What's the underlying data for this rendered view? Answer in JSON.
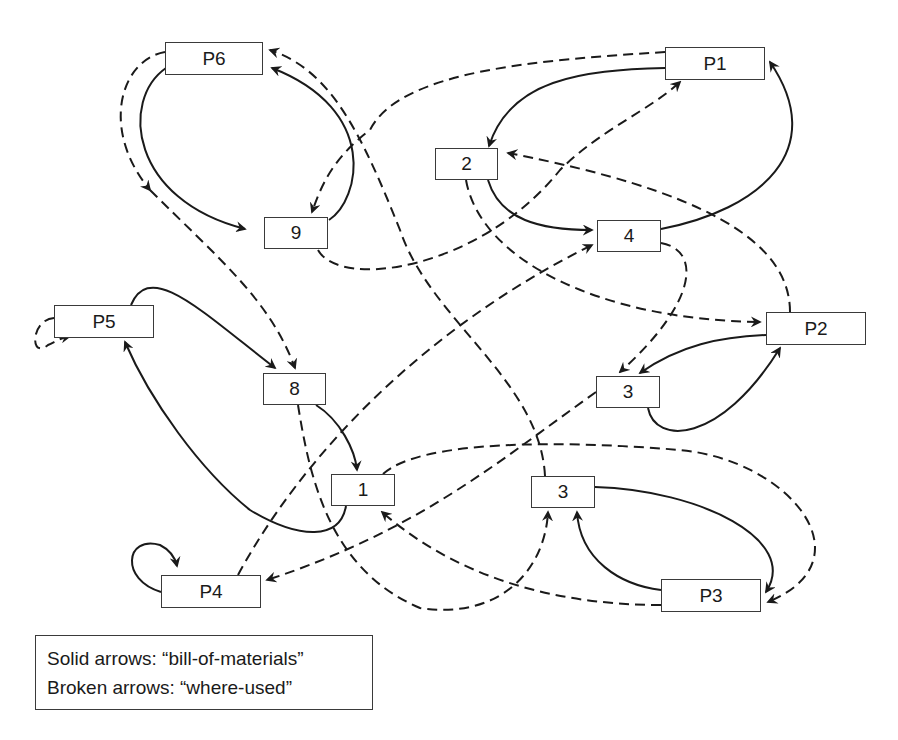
{
  "diagram": {
    "nodes": [
      {
        "id": "P6",
        "label": "P6",
        "x": 165,
        "y": 42,
        "w": 98,
        "h": 33
      },
      {
        "id": "P1",
        "label": "P1",
        "x": 665,
        "y": 47,
        "w": 100,
        "h": 33
      },
      {
        "id": "n2",
        "label": "2",
        "x": 435,
        "y": 148,
        "w": 63,
        "h": 32
      },
      {
        "id": "n9",
        "label": "9",
        "x": 264,
        "y": 217,
        "w": 64,
        "h": 32
      },
      {
        "id": "n4",
        "label": "4",
        "x": 597,
        "y": 220,
        "w": 64,
        "h": 32
      },
      {
        "id": "P5",
        "label": "P5",
        "x": 54,
        "y": 305,
        "w": 100,
        "h": 33
      },
      {
        "id": "P2",
        "label": "P2",
        "x": 766,
        "y": 312,
        "w": 100,
        "h": 33
      },
      {
        "id": "n8",
        "label": "8",
        "x": 263,
        "y": 373,
        "w": 63,
        "h": 32
      },
      {
        "id": "n3a",
        "label": "3",
        "x": 596,
        "y": 376,
        "w": 64,
        "h": 32
      },
      {
        "id": "n1",
        "label": "1",
        "x": 331,
        "y": 474,
        "w": 64,
        "h": 32
      },
      {
        "id": "n3b",
        "label": "3",
        "x": 531,
        "y": 476,
        "w": 64,
        "h": 32
      },
      {
        "id": "P4",
        "label": "P4",
        "x": 161,
        "y": 575,
        "w": 100,
        "h": 33
      },
      {
        "id": "P3",
        "label": "P3",
        "x": 661,
        "y": 579,
        "w": 100,
        "h": 33
      }
    ],
    "edges": [
      {
        "type": "solid",
        "from": "P6",
        "to": "n9",
        "d": "M166,68 C120,100 130,200 245,229"
      },
      {
        "type": "solid",
        "from": "n9",
        "to": "P6",
        "d": "M329,220 C360,200 380,110 272,68"
      },
      {
        "type": "dashed",
        "from": "n9",
        "to": "P6",
        "d": "M165,52 C120,60 100,130 150,190"
      },
      {
        "type": "solid",
        "from": "P1",
        "to": "n2",
        "d": "M665,68 C580,70 510,80 489,146"
      },
      {
        "type": "solid",
        "from": "n2",
        "to": "n4",
        "d": "M488,180 C500,220 540,230 592,230"
      },
      {
        "type": "solid",
        "from": "n4",
        "to": "P1",
        "d": "M661,229 C760,210 830,150 770,62"
      },
      {
        "type": "dashed",
        "from": "n9",
        "to": "P1",
        "d": "M318,250 C340,290 480,270 560,170 C600,130 650,110 680,82"
      },
      {
        "type": "dashed",
        "from": "P1",
        "to": "n9",
        "d": "M665,52 C540,60 400,70 370,130 C330,160 320,190 312,212"
      },
      {
        "type": "dashed",
        "from": "P2",
        "to": "n2",
        "d": "M790,312 C790,240 700,190 508,153"
      },
      {
        "type": "dashed",
        "from": "n2",
        "to": "P2",
        "d": "M466,180 C480,260 600,320 760,322"
      },
      {
        "type": "dashed",
        "from": "n4",
        "to": "n3a",
        "d": "M661,243 C700,250 700,300 620,372"
      },
      {
        "type": "dashed",
        "from": "P4",
        "to": "n4",
        "d": "M238,575 C300,460 420,330 592,245"
      },
      {
        "type": "solid",
        "from": "P2",
        "to": "n3a",
        "d": "M766,335 C720,337 680,345 640,373"
      },
      {
        "type": "solid",
        "from": "n3a",
        "to": "P2",
        "d": "M648,408 C655,445 720,445 780,348"
      },
      {
        "type": "solid",
        "from": "P5",
        "to": "n8",
        "d": "M131,305 C150,260 200,310 275,368"
      },
      {
        "type": "solid",
        "from": "n1",
        "to": "P5",
        "d": "M346,506 C340,540 300,540 250,510 C200,470 150,400 125,342"
      },
      {
        "type": "dashed",
        "from": "P5",
        "to": "P5",
        "d": "M54,318 C30,320 30,360 48,345 C55,342 60,338 70,336"
      },
      {
        "type": "dashed",
        "from": "P6",
        "to": "n8",
        "d": "M150,190 C220,260 270,300 295,368"
      },
      {
        "type": "solid",
        "from": "n8",
        "to": "n1",
        "d": "M316,405 C340,420 355,450 357,470"
      },
      {
        "type": "dashed",
        "from": "n8",
        "to": "n3b",
        "d": "M298,405 C310,480 330,570 420,608 C500,620 545,570 548,512"
      },
      {
        "type": "dashed",
        "from": "n3b",
        "to": "P6",
        "d": "M545,476 C540,380 430,320 400,230 C360,130 330,70 270,50"
      },
      {
        "type": "dashed",
        "from": "n3a",
        "to": "P4",
        "d": "M596,392 C500,460 420,530 267,580"
      },
      {
        "type": "dashed",
        "from": "n1",
        "to": "P3",
        "d": "M383,474 C420,440 560,440 680,450 C790,460 870,560 768,602"
      },
      {
        "type": "dashed",
        "from": "P3",
        "to": "n1",
        "d": "M661,605 C560,605 460,580 382,512"
      },
      {
        "type": "solid",
        "from": "n3b",
        "to": "P3",
        "d": "M595,487 C700,490 800,540 766,592"
      },
      {
        "type": "solid",
        "from": "P3",
        "to": "n3b",
        "d": "M661,590 C620,585 580,560 577,512"
      },
      {
        "type": "solid",
        "from": "P4",
        "to": "P4",
        "d": "M161,592 C120,580 125,535 160,545 C170,550 175,557 177,566"
      }
    ]
  },
  "legend": {
    "line1": "Solid arrows: “bill-of-materials”",
    "line2": "Broken arrows: “where-used”"
  }
}
